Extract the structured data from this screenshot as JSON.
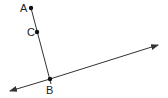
{
  "diagram": {
    "type": "geometry",
    "points": [
      {
        "label": "A",
        "x": 31,
        "y": 8,
        "label_x": 20,
        "label_y": 12
      },
      {
        "label": "C",
        "x": 37,
        "y": 32,
        "label_x": 27,
        "label_y": 36
      },
      {
        "label": "B",
        "x": 50,
        "y": 79,
        "label_x": 46,
        "label_y": 94
      }
    ],
    "segment": {
      "from": "A",
      "to": "B",
      "extends_past": "B"
    },
    "line": {
      "start": [
        10,
        91
      ],
      "end": [
        158,
        45
      ],
      "arrows": "both",
      "passes_through": "B"
    },
    "colors": {
      "stroke": "#333333",
      "point": "#111111",
      "text": "#222222"
    }
  }
}
